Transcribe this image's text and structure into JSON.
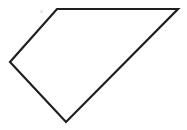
{
  "figure": {
    "name": "quadrilateral-outline",
    "type": "polygon",
    "sides": 4,
    "background_color": "#ffffff",
    "stroke_color": "#1f1f1f",
    "stroke_width": 2.2,
    "fill": "none",
    "canvas": {
      "width": 187,
      "height": 130
    },
    "vertices": [
      {
        "id": "top-left-apex",
        "x": 57,
        "y": 9
      },
      {
        "id": "top-right",
        "x": 178,
        "y": 9
      },
      {
        "id": "bottom",
        "x": 66,
        "y": 122
      },
      {
        "id": "left",
        "x": 10,
        "y": 62
      }
    ],
    "points_attr": "57,9 178,9 66,122 10,62",
    "edges": [
      {
        "id": "top-edge",
        "from": "top-left-apex",
        "to": "top-right",
        "orientation": "horizontal"
      },
      {
        "id": "right-diagonal-edge",
        "from": "top-right",
        "to": "bottom",
        "orientation": "diagonal"
      },
      {
        "id": "bottom-left-edge",
        "from": "bottom",
        "to": "left",
        "orientation": "diagonal"
      },
      {
        "id": "upper-left-edge",
        "from": "left",
        "to": "top-left-apex",
        "orientation": "diagonal"
      }
    ],
    "artifacts": [
      {
        "id": "gray-speck",
        "x": 40,
        "y": 10,
        "color": "#e2e2e2"
      }
    ]
  }
}
